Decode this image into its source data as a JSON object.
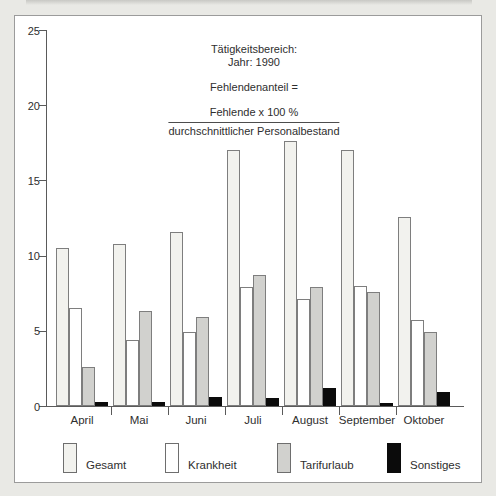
{
  "annotation": {
    "line1": "Tätigkeitsbereich:",
    "line2": "Jahr: 1990",
    "formula": "Fehlendenanteil =",
    "numerator": "Fehlende x 100 %",
    "denominator": "durchschnittlicher Personalbestand"
  },
  "chart_data": {
    "type": "bar",
    "title": "",
    "categories": [
      "April",
      "Mai",
      "Juni",
      "Juli",
      "August",
      "September",
      "Oktober"
    ],
    "series": [
      {
        "name": "Gesamt",
        "color": "#f2f2ee",
        "border": "#7e7e7e",
        "values": [
          10.5,
          10.8,
          11.6,
          17.0,
          17.6,
          17.0,
          12.6
        ]
      },
      {
        "name": "Krankheit",
        "color": "#ffffff",
        "border": "#7e7e7e",
        "values": [
          6.5,
          4.4,
          4.9,
          7.9,
          7.1,
          8.0,
          5.7
        ]
      },
      {
        "name": "Tarifurlaub",
        "color": "#d1d1ce",
        "border": "#7e7e7e",
        "values": [
          2.6,
          6.3,
          5.9,
          8.7,
          7.9,
          7.6,
          4.9
        ]
      },
      {
        "name": "Sonstiges",
        "color": "#0b0b0b",
        "border": "#0b0b0b",
        "values": [
          0.3,
          0.3,
          0.6,
          0.5,
          1.2,
          0.2,
          0.9
        ]
      }
    ],
    "xlabel": "",
    "ylabel": "",
    "ylim": [
      0,
      25
    ],
    "yticks": [
      0,
      5,
      10,
      15,
      20,
      25
    ],
    "grid": false,
    "legend_position": "bottom"
  }
}
